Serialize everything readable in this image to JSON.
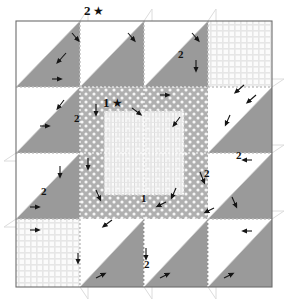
{
  "diagram": {
    "type": "quilt-block",
    "grid": {
      "columns": 4,
      "rows": 4,
      "unit_px": 64
    },
    "block": {
      "x": 16,
      "y": 21,
      "width": 256,
      "height": 266
    },
    "colors": {
      "triangle_gray": "#9a9a9a",
      "background_white": "#ffffff",
      "dot_fabric_bg": "#b0b0b0",
      "dot_fabric_dot": "#f6f6f6",
      "grid_fabric_bg": "#fafafa",
      "grid_fabric_line": "#e2e2e2",
      "hatch_fabric_bg": "#f4f4f4",
      "hatch_fabric_line": "#d6d6d6",
      "outline": "#6d6d6d",
      "seam_dotted": "#ffffff",
      "arrow": "#151515",
      "label_text": "#111111"
    },
    "labels": [
      {
        "id": "top-star",
        "text": "2",
        "star": true,
        "x": 84,
        "y": 15
      },
      {
        "id": "center-star",
        "text": "1",
        "star": true,
        "x": 103,
        "y": 107
      },
      {
        "id": "inner-one",
        "text": "1",
        "star": false,
        "x": 141,
        "y": 202
      },
      {
        "id": "left-upper",
        "text": "2",
        "star": false,
        "x": 74,
        "y": 122
      },
      {
        "id": "left-lower",
        "text": "2",
        "star": false,
        "x": 41,
        "y": 195
      },
      {
        "id": "top-right",
        "text": "2",
        "star": false,
        "x": 178,
        "y": 58
      },
      {
        "id": "right-upper",
        "text": "2",
        "star": false,
        "x": 236,
        "y": 159
      },
      {
        "id": "right-mid",
        "text": "2",
        "star": false,
        "x": 204,
        "y": 177
      },
      {
        "id": "bottom-mid",
        "text": "2",
        "star": false,
        "x": 144,
        "y": 268
      }
    ],
    "legend_note": "Numbers mark fabric pieces; stars mark starting units; arrowheads show seam pressing direction.",
    "caption": ""
  }
}
